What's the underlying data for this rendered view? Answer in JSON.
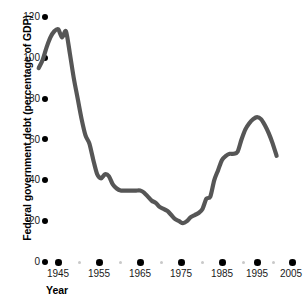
{
  "chart_data": {
    "type": "line",
    "title": "",
    "xlabel": "Year",
    "ylabel": "Federal government debt (percentage of GDP)",
    "xlim": [
      1940,
      2006
    ],
    "ylim": [
      0,
      120
    ],
    "grid": false,
    "legend": null,
    "line_color": "#565656",
    "axis_style": "dotted-tick-markers",
    "x_major_ticks": [
      1945,
      1955,
      1965,
      1975,
      1985,
      1995,
      2005
    ],
    "x_minor_ticks": [
      1940,
      1950,
      1960,
      1970,
      1980,
      1990,
      2000
    ],
    "y_ticks": [
      0,
      20,
      40,
      60,
      80,
      100,
      120
    ],
    "x_tick_labels": [
      "1945",
      "1955",
      "1965",
      "1975",
      "1985",
      "1995",
      "2005"
    ],
    "y_tick_labels": [
      "0",
      "20",
      "40",
      "60",
      "80",
      "100",
      "120"
    ],
    "x": [
      1940,
      1941,
      1942,
      1943,
      1944,
      1945,
      1946,
      1947,
      1948,
      1949,
      1950,
      1951,
      1952,
      1953,
      1954,
      1955,
      1956,
      1957,
      1958,
      1959,
      1960,
      1961,
      1962,
      1963,
      1964,
      1965,
      1966,
      1967,
      1968,
      1969,
      1970,
      1971,
      1972,
      1973,
      1974,
      1975,
      1976,
      1977,
      1978,
      1979,
      1980,
      1981,
      1982,
      1983,
      1984,
      1985,
      1986,
      1987,
      1988,
      1989,
      1990,
      1991,
      1992,
      1993,
      1994,
      1995,
      1996,
      1997,
      1998,
      1999,
      2000,
      2001
    ],
    "values": [
      95,
      99,
      105,
      110,
      113,
      114,
      110,
      113,
      102,
      90,
      80,
      70,
      62,
      58,
      50,
      43,
      41,
      43,
      42,
      38,
      36,
      35,
      35,
      35,
      35,
      35,
      35,
      34,
      32,
      30,
      29,
      27,
      26,
      25,
      23,
      21,
      20,
      19,
      20,
      22,
      23,
      24,
      26,
      31,
      32,
      40,
      45,
      50,
      52,
      53,
      53,
      54,
      60,
      65,
      68,
      70,
      71,
      70,
      67,
      63,
      58,
      52
    ],
    "series_name": "Federal government debt (percentage of GDP)",
    "notable_points": {
      "peak_wwii": {
        "year": 1946,
        "value": 114
      },
      "minimum": {
        "year": 1977,
        "value": 19
      },
      "peak_1990s": {
        "year": 1996,
        "value": 71
      },
      "end": {
        "year": 2001,
        "value": 52
      }
    }
  },
  "axes": {
    "y_title": "Federal government debt (percentage of GDP)",
    "x_title": "Year"
  }
}
